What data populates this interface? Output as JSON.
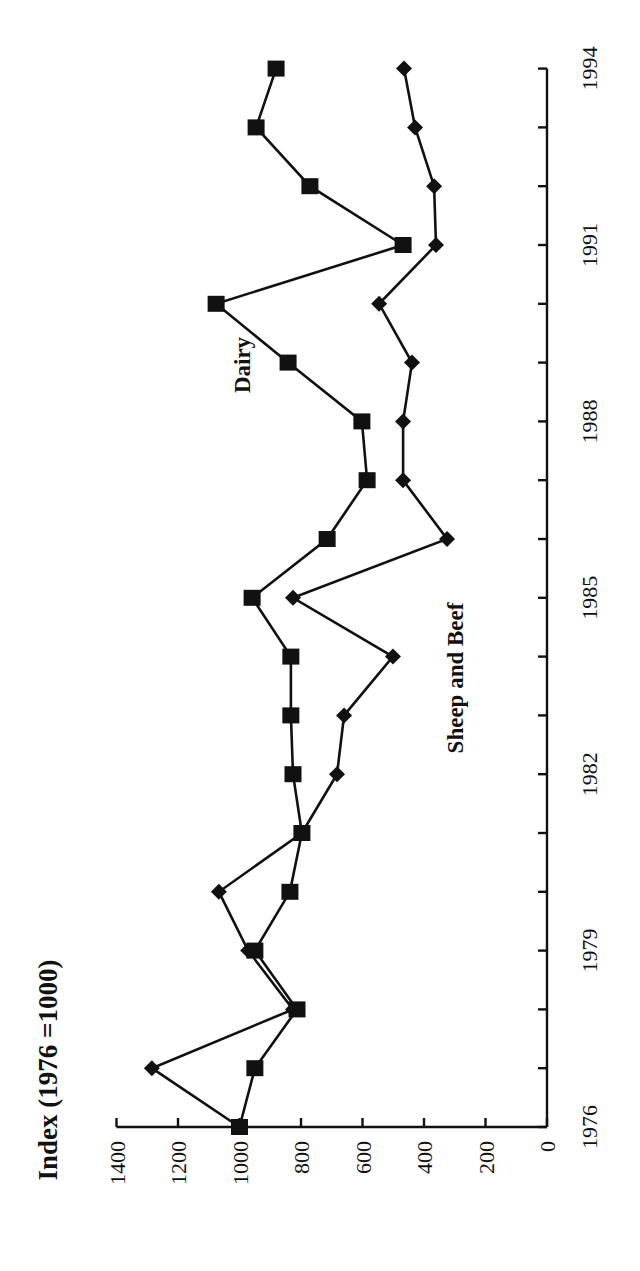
{
  "chart_data": {
    "type": "line",
    "title": "Index (1976 =1000)",
    "orientation": "rotated-90-ccw",
    "xlabel": "",
    "ylabel": "Index (1976 =1000)",
    "x": [
      1976,
      1977,
      1978,
      1979,
      1980,
      1981,
      1982,
      1983,
      1984,
      1985,
      1986,
      1987,
      1988,
      1989,
      1990,
      1991,
      1992,
      1993,
      1994
    ],
    "x_tick_labels": [
      "1976",
      "1979",
      "1982",
      "1985",
      "1988",
      "1991",
      "1994"
    ],
    "y_tick_labels": [
      "0",
      "200",
      "400",
      "600",
      "800",
      "1000",
      "1200",
      "1400"
    ],
    "ylim": [
      0,
      1400
    ],
    "grid": false,
    "legend": "inline labels",
    "series": [
      {
        "name": "Dairy",
        "marker": "square",
        "values": [
          1000,
          950,
          813,
          950,
          836,
          797,
          826,
          833,
          833,
          959,
          715,
          585,
          602,
          842,
          1076,
          468,
          771,
          946,
          881
        ]
      },
      {
        "name": "Sheep and Beef",
        "marker": "diamond",
        "values": [
          1000,
          1285,
          826,
          972,
          1067,
          797,
          683,
          660,
          501,
          826,
          325,
          468,
          468,
          439,
          546,
          361,
          367,
          429,
          465
        ]
      }
    ],
    "annotations": [
      {
        "text": "Dairy",
        "near": {
          "x": 1989,
          "y": 1000
        }
      },
      {
        "text": "Sheep and Beef",
        "near": {
          "x": 1984,
          "y": 300
        }
      }
    ]
  },
  "labels": {
    "title": "Index (1976 =1000)",
    "dairy": "Dairy",
    "sheep": "Sheep and Beef"
  },
  "colors": {
    "ink": "#111111",
    "background": "#ffffff"
  }
}
